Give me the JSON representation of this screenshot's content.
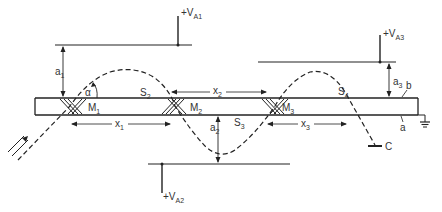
{
  "diagram": {
    "type": "multiple-reflection acousto/electro-optic crystal schematic",
    "colors": {
      "line": "#222222",
      "text": "#333333",
      "background": "#ffffff"
    },
    "electrodes": [
      {
        "id": "top-left",
        "voltage_label": "+V",
        "voltage_sub": "A1",
        "gap_label": "a",
        "gap_sub": "1"
      },
      {
        "id": "bottom",
        "voltage_label": "+V",
        "voltage_sub": "A2",
        "gap_label": "a",
        "gap_sub": "2"
      },
      {
        "id": "top-right",
        "voltage_label": "+V",
        "voltage_sub": "A3",
        "gap_label": "a",
        "gap_sub": "3"
      }
    ],
    "mirrors": [
      {
        "label": "M",
        "sub": "1"
      },
      {
        "label": "M",
        "sub": "2"
      },
      {
        "label": "M",
        "sub": "3"
      }
    ],
    "segments": [
      {
        "label": "S",
        "sub": "2"
      },
      {
        "label": "S",
        "sub": "3"
      },
      {
        "label": "S",
        "sub": "4"
      }
    ],
    "distances": [
      {
        "label": "x",
        "sub": "1"
      },
      {
        "label": "x",
        "sub": "2"
      },
      {
        "label": "x",
        "sub": "3"
      }
    ],
    "angle_label": "α",
    "surface_labels": {
      "top": "b",
      "bottom": "a"
    },
    "collector_label": "C",
    "ground": "ground"
  }
}
